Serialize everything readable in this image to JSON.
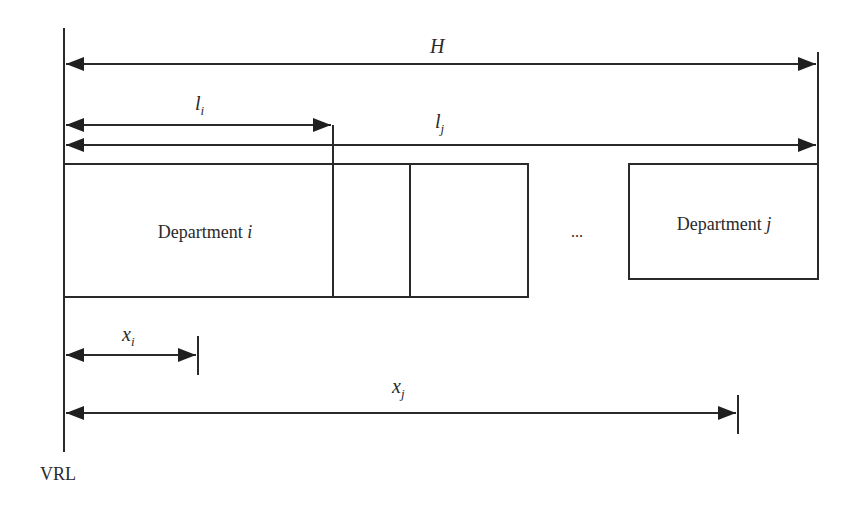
{
  "diagram": {
    "reference_line_label": "VRL",
    "dimensions": {
      "H": {
        "symbol": "H",
        "subscript": ""
      },
      "l_i": {
        "symbol": "l",
        "subscript": "i"
      },
      "l_j": {
        "symbol": "l",
        "subscript": "j"
      },
      "x_i": {
        "symbol": "x",
        "subscript": "i"
      },
      "x_j": {
        "symbol": "x",
        "subscript": "j"
      }
    },
    "departments": {
      "i": {
        "name": "Department",
        "index": "i"
      },
      "j": {
        "name": "Department",
        "index": "j"
      }
    },
    "ellipsis": "..."
  }
}
